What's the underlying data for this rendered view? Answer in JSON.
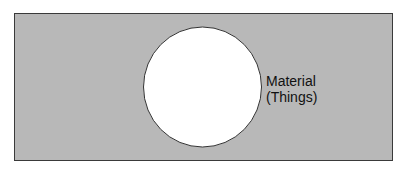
{
  "diagram": {
    "type": "venn-single-set",
    "universe": {
      "fill": "#b8b8b8",
      "stroke": "#3a3a3a"
    },
    "circle": {
      "fill": "#ffffff",
      "stroke": "#333333",
      "label_line1": "Material",
      "label_line2": "(Things)"
    }
  }
}
